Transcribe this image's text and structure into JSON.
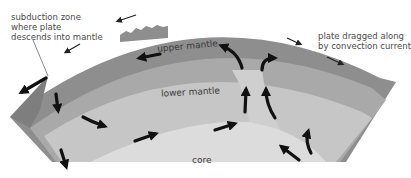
{
  "diagram": {
    "colors": {
      "background": "#ffffff",
      "crust_plate": "#8e8e8e",
      "upper_mantle": "#a9a9a9",
      "lower_mantle": "#c6c6c6",
      "core": "#dcdcdc",
      "arrow": "#111111",
      "text": "#444444"
    },
    "labels": {
      "subduction_line1": "subduction zone",
      "subduction_line2": "where plate",
      "subduction_line3": "descends into mantle",
      "plate_line1": "plate dragged along",
      "plate_line2": "by convection current",
      "upper_mantle": "upper mantle",
      "lower_mantle": "lower mantle",
      "core": "core"
    },
    "layers": [
      "plate",
      "upper mantle",
      "lower mantle",
      "core"
    ],
    "arrows": [
      {
        "region": "surface",
        "direction": "left",
        "location": "above plate near subduction zone"
      },
      {
        "region": "surface",
        "direction": "left",
        "location": "above mountain ridge"
      },
      {
        "region": "surface",
        "direction": "right-down",
        "location": "above plate right side"
      },
      {
        "region": "surface",
        "direction": "right-down",
        "location": "right plate edge"
      },
      {
        "region": "upper mantle",
        "direction": "left-down",
        "location": "left upper mantle"
      },
      {
        "region": "upper mantle",
        "direction": "left",
        "location": "below upper mantle label"
      },
      {
        "region": "upper mantle",
        "direction": "curving left",
        "location": "center plume top left"
      },
      {
        "region": "upper mantle",
        "direction": "curving right",
        "location": "center plume top right"
      },
      {
        "region": "lower mantle",
        "direction": "down",
        "location": "left lower mantle"
      },
      {
        "region": "lower mantle",
        "direction": "right",
        "location": "left lower mantle middle"
      },
      {
        "region": "lower mantle",
        "direction": "down",
        "location": "bottom left"
      },
      {
        "region": "lower mantle",
        "direction": "right-up",
        "location": "near core left"
      },
      {
        "region": "lower mantle",
        "direction": "right-up",
        "location": "near core center"
      },
      {
        "region": "lower mantle",
        "direction": "up",
        "location": "center plume left"
      },
      {
        "region": "lower mantle",
        "direction": "up",
        "location": "center plume right"
      },
      {
        "region": "lower mantle",
        "direction": "up-left",
        "location": "bottom right"
      },
      {
        "region": "lower mantle",
        "direction": "up",
        "location": "right lower mantle"
      }
    ]
  }
}
